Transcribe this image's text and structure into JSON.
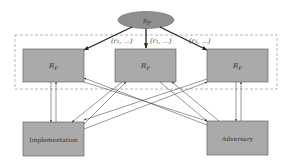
{
  "diagram": {
    "source_node": {
      "label_main": "s",
      "label_sub": "P"
    },
    "edge_labels": [
      "(r₁, …)",
      "(r₁, …)",
      "(r₁, …)"
    ],
    "top_nodes": [
      {
        "label_main": "R",
        "label_sub": "P"
      },
      {
        "label_main": "R",
        "label_sub": "P"
      },
      {
        "label_main": "R",
        "label_sub": "P"
      }
    ],
    "bottom_nodes": [
      {
        "label": "Implementation"
      },
      {
        "label": "Adversary"
      }
    ],
    "colors": {
      "node_fill": "#aaaaaa",
      "node_stroke": "#555555",
      "ellipse_fill": "#8f8f8f",
      "dashed_border": "#999999",
      "arrow": "#333333"
    }
  }
}
